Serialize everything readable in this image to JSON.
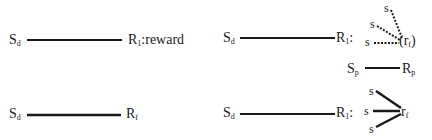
{
  "diagrams": {
    "top_left": {
      "stimulus": {
        "base": "S",
        "sub": "d"
      },
      "response": {
        "base": "R",
        "sub": "1"
      },
      "annotation": ":reward"
    },
    "bottom_left": {
      "stimulus": {
        "base": "S",
        "sub": "d"
      },
      "response": {
        "base": "R",
        "sub": "f"
      }
    },
    "top_right": {
      "stimulus": {
        "base": "S",
        "sub": "d"
      },
      "response": {
        "base": "R",
        "sub": "1"
      },
      "colon": ":",
      "fan_sources": [
        "s",
        "s",
        "s"
      ],
      "fan_target": {
        "open": "(",
        "base": "r",
        "sub": "f",
        "close": ")"
      },
      "fan_style": "dotted",
      "secondary": {
        "stimulus": {
          "base": "S",
          "sub": "p"
        },
        "response": {
          "base": "R",
          "sub": "p"
        }
      }
    },
    "bottom_right": {
      "stimulus": {
        "base": "S",
        "sub": "d"
      },
      "response": {
        "base": "R",
        "sub": "1"
      },
      "colon": ":",
      "fan_sources": [
        "s",
        "s",
        "s"
      ],
      "fan_target": {
        "base": "r",
        "sub": "f"
      },
      "fan_style": "solid"
    }
  },
  "colors": {
    "ink": "#1a1a1a",
    "background": "#ffffff"
  }
}
